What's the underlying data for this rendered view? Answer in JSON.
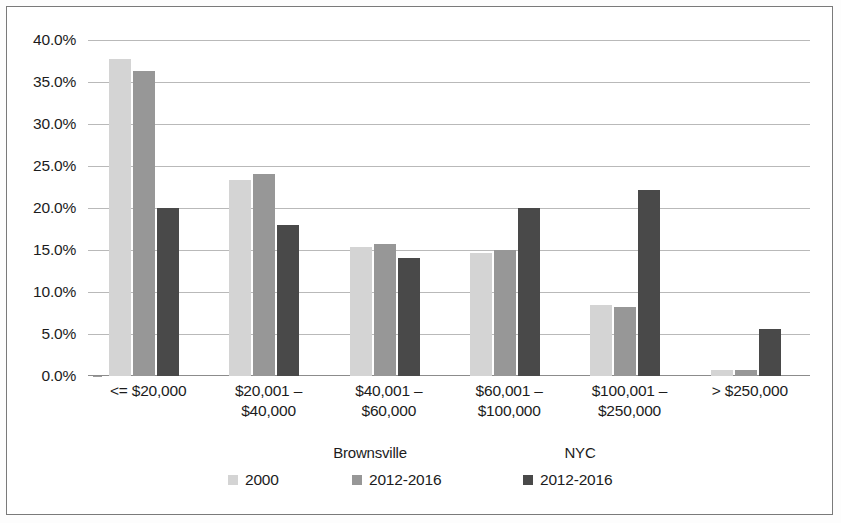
{
  "chart_data": {
    "type": "bar",
    "title": "",
    "subtitle": "",
    "xlabel": "",
    "ylabel": "",
    "grid": true,
    "legend_position": "bottom",
    "ylim": [
      0,
      40
    ],
    "ytick_labels": [
      "40.0%",
      "35.0%",
      "30.0%",
      "25.0%",
      "20.0%",
      "15.0%",
      "10.0%",
      "5.0%",
      "0.0%"
    ],
    "ytick_values": [
      40,
      35,
      30,
      25,
      20,
      15,
      10,
      5,
      0
    ],
    "categories": [
      "<= $20,000",
      "$20,001 –\n$40,000",
      "$40,001 –\n$60,000",
      "$60,001 –\n$100,000",
      "$100,001 –\n$250,000",
      "> $250,000"
    ],
    "series": [
      {
        "name": "2000",
        "group": "Brownsville",
        "color": "#d4d4d4",
        "values": [
          37.7,
          23.3,
          15.3,
          14.7,
          8.4,
          0.7
        ]
      },
      {
        "name": "2012-2016",
        "group": "Brownsville",
        "color": "#979797",
        "values": [
          36.3,
          24.0,
          15.7,
          15.0,
          8.2,
          0.7
        ]
      },
      {
        "name": "2012-2016",
        "group": "NYC",
        "color": "#494949",
        "values": [
          20.0,
          18.0,
          14.0,
          20.0,
          22.1,
          5.6
        ]
      }
    ]
  },
  "legend": {
    "groups": [
      {
        "label": "Brownsville"
      },
      {
        "label": "NYC"
      }
    ],
    "entries": [
      {
        "label": "2000",
        "color": "#d4d4d4"
      },
      {
        "label": "2012-2016",
        "color": "#979797"
      },
      {
        "label": "2012-2016",
        "color": "#494949"
      }
    ]
  }
}
